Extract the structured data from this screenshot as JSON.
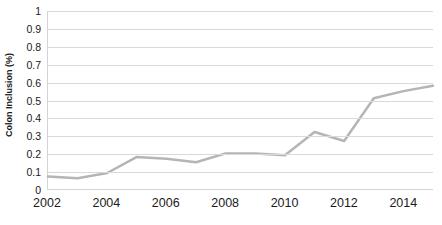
{
  "chart_data": {
    "type": "line",
    "title": "",
    "xlabel": "",
    "ylabel": "Colon Inclusion (%)",
    "x": [
      2002,
      2003,
      2004,
      2005,
      2006,
      2007,
      2008,
      2009,
      2010,
      2011,
      2012,
      2013,
      2014,
      2015
    ],
    "values": [
      0.07,
      0.06,
      0.09,
      0.18,
      0.17,
      0.15,
      0.2,
      0.2,
      0.19,
      0.32,
      0.27,
      0.51,
      0.55,
      0.58
    ],
    "series": [
      {
        "name": "Colon Inclusion (%)",
        "color": "#b5b5b5",
        "values": [
          0.07,
          0.06,
          0.09,
          0.18,
          0.17,
          0.15,
          0.2,
          0.2,
          0.19,
          0.32,
          0.27,
          0.51,
          0.55,
          0.58
        ]
      }
    ],
    "xlim": [
      2002,
      2015
    ],
    "ylim": [
      0,
      1
    ],
    "y_ticks": [
      0,
      0.1,
      0.2,
      0.3,
      0.4,
      0.5,
      0.6,
      0.7,
      0.8,
      0.9,
      1
    ],
    "y_tick_labels": [
      "0",
      "0.1",
      "0.2",
      "0.3",
      "0.4",
      "0.5",
      "0.6",
      "0.7",
      "0.8",
      "0.9",
      "1"
    ],
    "x_ticks": [
      2002,
      2004,
      2006,
      2008,
      2010,
      2012,
      2014
    ],
    "x_tick_labels": [
      "2002",
      "2004",
      "2006",
      "2008",
      "2010",
      "2012",
      "2014"
    ],
    "grid": "horizontal",
    "legend": "none",
    "markers": false,
    "line_width": 2.5,
    "colors": {
      "line": "#b5b5b5",
      "gridline": "#d9d9d9",
      "axis": "#d4d4d4",
      "text": "#1a1a1a",
      "background": "#ffffff"
    }
  }
}
